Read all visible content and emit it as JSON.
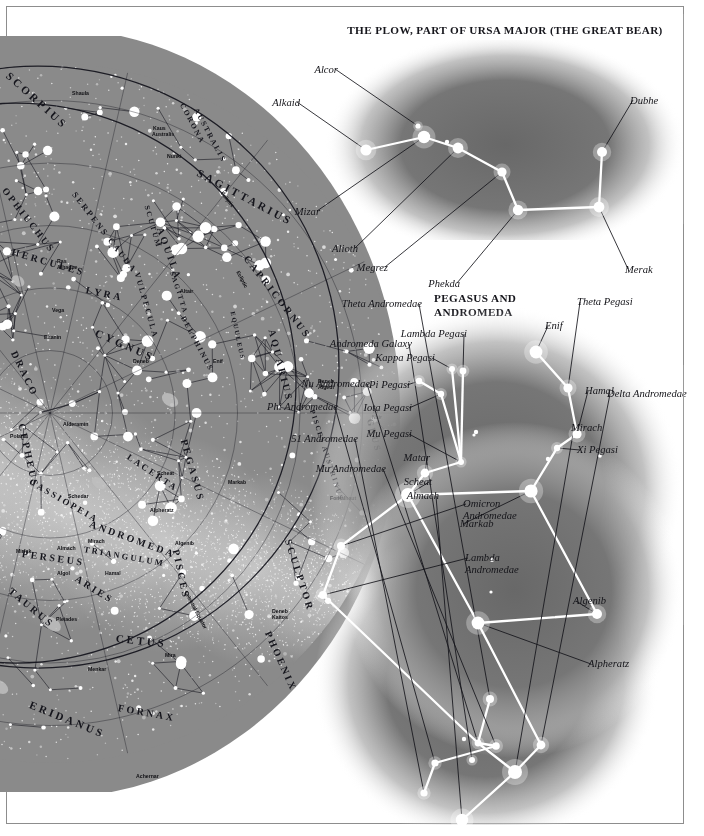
{
  "page": {
    "kind": "astronomy-plate",
    "background_color": "#ffffff",
    "frame_color": "#8d8d8d",
    "sky_color": "#8a8a8a",
    "star_color": "#ffffff",
    "line_color": "#14141a",
    "constellation_line_color": "#ffffff"
  },
  "plow": {
    "title": "THE PLOW, PART OF URSA MAJOR (THE GREAT BEAR)",
    "stars": [
      {
        "name": "Alkaid",
        "x": 66,
        "y": 110,
        "r": 5.6,
        "label_x": 0,
        "label_y": 57,
        "align": "right"
      },
      {
        "name": "Mizar",
        "x": 124,
        "y": 97,
        "r": 6.2,
        "label_x": 20,
        "label_y": 166,
        "align": "right"
      },
      {
        "name": "Alcor",
        "x": 118,
        "y": 86,
        "r": 2.6,
        "label_x": 38,
        "label_y": 24,
        "align": "right"
      },
      {
        "name": "Alioth",
        "x": 158,
        "y": 108,
        "r": 5.4,
        "label_x": 58,
        "label_y": 203,
        "align": "right"
      },
      {
        "name": "Megrez",
        "x": 202,
        "y": 132,
        "r": 4.6,
        "label_x": 88,
        "label_y": 222,
        "align": "right"
      },
      {
        "name": "Phekda",
        "x": 218,
        "y": 170,
        "r": 5.2,
        "label_x": 160,
        "label_y": 238,
        "align": "right"
      },
      {
        "name": "Merak",
        "x": 299,
        "y": 167,
        "r": 5.4,
        "label_x": 325,
        "label_y": 224,
        "align": "left"
      },
      {
        "name": "Dubhe",
        "x": 302,
        "y": 112,
        "r": 5.0,
        "label_x": 330,
        "label_y": 55,
        "align": "left"
      }
    ],
    "unlabeled_stars": [
      {
        "x": 147,
        "y": 102,
        "r": 2.2
      }
    ],
    "links": [
      [
        "Alkaid",
        "Mizar"
      ],
      [
        "Mizar",
        "Alioth"
      ],
      [
        "Alioth",
        "Megrez"
      ],
      [
        "Megrez",
        "Phekda"
      ],
      [
        "Phekda",
        "Merak"
      ],
      [
        "Merak",
        "Dubhe"
      ]
    ]
  },
  "pegasus": {
    "title_line1": "PEGASUS AND",
    "title_line2": "ANDROMEDA",
    "stars": [
      {
        "name": "Theta Pegasi",
        "x": 268,
        "y": 108,
        "r": 4.6,
        "label_x": 277,
        "label_y": 16,
        "align": "left"
      },
      {
        "name": "Enif",
        "x": 236,
        "y": 72,
        "r": 6.4,
        "label_x": 245,
        "label_y": 40,
        "align": "left"
      },
      {
        "name": "Hamal",
        "x": 277,
        "y": 154,
        "r": 4.6,
        "label_x": 285,
        "label_y": 105,
        "align": "left"
      },
      {
        "name": "Xi Pegasi",
        "x": 257,
        "y": 168,
        "r": 3.2,
        "label_x": 277,
        "label_y": 164,
        "align": "left"
      },
      {
        "name": "Markab",
        "x": 231,
        "y": 211,
        "r": 6.6,
        "label_x": 160,
        "label_y": 238,
        "align": "left"
      },
      {
        "name": "Algenib",
        "x": 297,
        "y": 334,
        "r": 5.0,
        "label_x": 273,
        "label_y": 315,
        "align": "left"
      },
      {
        "name": "Alpheratz",
        "x": 178,
        "y": 343,
        "r": 6.4,
        "label_x": 288,
        "label_y": 378,
        "align": "left"
      },
      {
        "name": "Lambda Pegasi",
        "x": 163,
        "y": 91,
        "r": 3.4,
        "label_x": 167,
        "label_y": 48,
        "align": "right"
      },
      {
        "name": "Kappa Pegasi",
        "x": 152,
        "y": 89,
        "r": 3.0,
        "label_x": 135,
        "label_y": 72,
        "align": "right"
      },
      {
        "name": "Pi Pegasi",
        "x": 119,
        "y": 101,
        "r": 3.2,
        "label_x": 110,
        "label_y": 99,
        "align": "right"
      },
      {
        "name": "Iota Pegasi",
        "x": 141,
        "y": 114,
        "r": 3.2,
        "label_x": 112,
        "label_y": 122,
        "align": "right"
      },
      {
        "name": "Mu Pegasi",
        "x": 161,
        "y": 182,
        "r": 3.0,
        "label_x": 112,
        "label_y": 148,
        "align": "right"
      },
      {
        "name": "Matar",
        "x": 125,
        "y": 193,
        "r": 4.4,
        "label_x": 130,
        "label_y": 172,
        "align": "right"
      },
      {
        "name": "Scheat",
        "x": 108,
        "y": 215,
        "r": 7.0,
        "label_x": 132,
        "label_y": 196,
        "align": "right"
      },
      {
        "name": "Omicron Andromedae",
        "x": 41,
        "y": 266,
        "r": 4.0,
        "label_x": 163,
        "label_y": 218,
        "align": "left"
      },
      {
        "name": "Lambda Andromedae",
        "x": 23,
        "y": 315,
        "r": 4.0,
        "label_x": 165,
        "label_y": 272,
        "align": "left"
      },
      {
        "name": "Theta Andromedae",
        "x": 190,
        "y": 419,
        "r": 4.0,
        "label_x": 122,
        "label_y": 18,
        "align": "right"
      },
      {
        "name": "Andromeda Galaxy",
        "x": 172,
        "y": 480,
        "r": 3.0,
        "label_x": 112,
        "label_y": 58,
        "align": "right"
      },
      {
        "name": "Nu Andromedae",
        "x": 178,
        "y": 463,
        "r": 3.4,
        "label_x": 70,
        "label_y": 98,
        "align": "right"
      },
      {
        "name": "Phi Andromedae",
        "x": 135,
        "y": 483,
        "r": 3.6,
        "label_x": 38,
        "label_y": 121,
        "align": "right"
      },
      {
        "name": "51 Andromedae",
        "x": 124,
        "y": 513,
        "r": 3.6,
        "label_x": 58,
        "label_y": 153,
        "align": "right"
      },
      {
        "name": "Mu Andromedae",
        "x": 196,
        "y": 466,
        "r": 3.8,
        "label_x": 86,
        "label_y": 183,
        "align": "right"
      },
      {
        "name": "Almach",
        "x": 162,
        "y": 540,
        "r": 6.2,
        "label_x": 139,
        "label_y": 210,
        "align": "right"
      },
      {
        "name": "Mirach",
        "x": 215,
        "y": 492,
        "r": 7.0,
        "label_x": 271,
        "label_y": 142,
        "align": "left"
      },
      {
        "name": "Delta Andromedae",
        "x": 241,
        "y": 465,
        "r": 4.4,
        "label_x": 307,
        "label_y": 108,
        "align": "left"
      }
    ],
    "unlabeled_stars": [
      {
        "x": 248,
        "y": 179,
        "r": 2.2
      },
      {
        "x": 300,
        "y": 176,
        "r": 1.8
      },
      {
        "x": 176,
        "y": 152,
        "r": 2.2
      },
      {
        "x": 174,
        "y": 155,
        "r": 1.6
      },
      {
        "x": 192,
        "y": 280,
        "r": 2.0
      },
      {
        "x": 191,
        "y": 312,
        "r": 1.6
      },
      {
        "x": 164,
        "y": 459,
        "r": 2.2
      }
    ],
    "links": [
      [
        "Enif",
        "Theta Pegasi"
      ],
      [
        "Theta Pegasi",
        "Hamal"
      ],
      [
        "Hamal",
        "Xi Pegasi"
      ],
      [
        "Xi Pegasi",
        "Markab"
      ],
      [
        "Markab",
        "Algenib"
      ],
      [
        "Algenib",
        "Alpheratz"
      ],
      [
        "Markab",
        "Scheat"
      ],
      [
        "Scheat",
        "Alpheratz"
      ],
      [
        "Scheat",
        "Matar"
      ],
      [
        "Matar",
        "Mu Pegasi"
      ],
      [
        "Mu Pegasi",
        "Iota Pegasi"
      ],
      [
        "Iota Pegasi",
        "Pi Pegasi"
      ],
      [
        "Mu Pegasi",
        "Kappa Pegasi"
      ],
      [
        "Mu Pegasi",
        "Lambda Pegasi"
      ],
      [
        "Scheat",
        "Omicron Andromedae"
      ],
      [
        "Omicron Andromedae",
        "Lambda Andromedae"
      ],
      [
        "Lambda Andromedae",
        "Nu Andromedae"
      ],
      [
        "Alpheratz",
        "Delta Andromedae"
      ],
      [
        "Delta Andromedae",
        "Mirach"
      ],
      [
        "Mirach",
        "Nu Andromedae"
      ],
      [
        "Nu Andromedae",
        "Theta Andromedae"
      ],
      [
        "Nu Andromedae",
        "Mu Andromedae"
      ],
      [
        "Mu Andromedae",
        "Phi Andromedae"
      ],
      [
        "Phi Andromedae",
        "51 Andromedae"
      ],
      [
        "Mirach",
        "Almach"
      ]
    ]
  },
  "starmap": {
    "constellations": [
      {
        "label": "SCORPIUS",
        "x": 8,
        "y": 32,
        "size": 11,
        "rot": 42
      },
      {
        "label": "CORONA",
        "x": 182,
        "y": 63,
        "size": 7.5,
        "rot": 62
      },
      {
        "label": "AUSTRALIS",
        "x": 196,
        "y": 68,
        "size": 7.5,
        "rot": 62
      },
      {
        "label": "SAGITTARIUS",
        "x": 198,
        "y": 130,
        "size": 11,
        "rot": 28
      },
      {
        "label": "OPHIUCHUS",
        "x": 4,
        "y": 148,
        "size": 9.5,
        "rot": 52
      },
      {
        "label": "SERPENS CAUDA",
        "x": 74,
        "y": 152,
        "size": 8.5,
        "rot": 52
      },
      {
        "label": "SCUTUM",
        "x": 147,
        "y": 165,
        "size": 7.5,
        "rot": 74
      },
      {
        "label": "HERCULES",
        "x": 12,
        "y": 210,
        "size": 10,
        "rot": 16
      },
      {
        "label": "AQUILA",
        "x": 160,
        "y": 186,
        "size": 10,
        "rot": 70
      },
      {
        "label": "CAPRICORNUS",
        "x": 246,
        "y": 215,
        "size": 10,
        "rot": 52
      },
      {
        "label": "LYRA",
        "x": 86,
        "y": 248,
        "size": 10,
        "rot": 12
      },
      {
        "label": "VULPECULA",
        "x": 137,
        "y": 232,
        "size": 8,
        "rot": 74
      },
      {
        "label": "SAGITTA",
        "x": 172,
        "y": 232,
        "size": 7,
        "rot": 72
      },
      {
        "label": "DELPHINUS",
        "x": 183,
        "y": 276,
        "size": 7.5,
        "rot": 62
      },
      {
        "label": "CYGNUS",
        "x": 96,
        "y": 290,
        "size": 11,
        "rot": 24
      },
      {
        "label": "DRACO",
        "x": 14,
        "y": 310,
        "size": 10,
        "rot": 64
      },
      {
        "label": "EQUULEUS",
        "x": 233,
        "y": 272,
        "size": 6.5,
        "rot": 78
      },
      {
        "label": "AQUARIUS",
        "x": 272,
        "y": 288,
        "size": 10,
        "rot": 76
      },
      {
        "label": "CEPHEUS",
        "x": 22,
        "y": 382,
        "size": 10,
        "rot": 78
      },
      {
        "label": "LACERTA",
        "x": 128,
        "y": 415,
        "size": 9,
        "rot": 34
      },
      {
        "label": "PEGASUS",
        "x": 184,
        "y": 398,
        "size": 10,
        "rot": 74
      },
      {
        "label": "PISCES AUSTRINUS",
        "x": 312,
        "y": 370,
        "size": 7,
        "rot": 72
      },
      {
        "label": "GRUS",
        "x": 370,
        "y": 378,
        "size": 9,
        "rot": 76
      },
      {
        "label": "CASSIOPEIA",
        "x": 30,
        "y": 440,
        "size": 9,
        "rot": 30
      },
      {
        "label": "ANDROMEDA",
        "x": 90,
        "y": 482,
        "size": 10,
        "rot": 20
      },
      {
        "label": "PISCES",
        "x": 176,
        "y": 508,
        "size": 10,
        "rot": 78
      },
      {
        "label": "SCULPTOR",
        "x": 288,
        "y": 498,
        "size": 10,
        "rot": 72
      },
      {
        "label": "PERSEUS",
        "x": 22,
        "y": 512,
        "size": 10,
        "rot": 8
      },
      {
        "label": "TRIANGULUM",
        "x": 84,
        "y": 508,
        "size": 8.5,
        "rot": 10
      },
      {
        "label": "ARIES",
        "x": 76,
        "y": 536,
        "size": 10,
        "rot": 32
      },
      {
        "label": "TAURUS",
        "x": 10,
        "y": 548,
        "size": 10,
        "rot": 40
      },
      {
        "label": "CETUS",
        "x": 116,
        "y": 596,
        "size": 11,
        "rot": 6
      },
      {
        "label": "PHOENIX",
        "x": 268,
        "y": 590,
        "size": 10,
        "rot": 66
      },
      {
        "label": "ERIDANUS",
        "x": 30,
        "y": 662,
        "size": 11,
        "rot": 22
      },
      {
        "label": "FORNAX",
        "x": 118,
        "y": 666,
        "size": 10,
        "rot": 10
      }
    ],
    "stars_named": [
      {
        "label": "Shaula",
        "x": 72,
        "y": 54
      },
      {
        "label": "Kaus",
        "x": 153,
        "y": 89
      },
      {
        "label": "Australis",
        "x": 152,
        "y": 95
      },
      {
        "label": "Nunki",
        "x": 167,
        "y": 117
      },
      {
        "label": "Ras",
        "x": 57,
        "y": 222
      },
      {
        "label": "Alhague",
        "x": 57,
        "y": 228
      },
      {
        "label": "Altair",
        "x": 180,
        "y": 252
      },
      {
        "label": "Vega",
        "x": 52,
        "y": 271
      },
      {
        "label": "Eltanin",
        "x": 44,
        "y": 298
      },
      {
        "label": "Deneb",
        "x": 133,
        "y": 322
      },
      {
        "label": "Enif",
        "x": 213,
        "y": 322
      },
      {
        "label": "Deneb",
        "x": 318,
        "y": 342
      },
      {
        "label": "Algedi",
        "x": 318,
        "y": 348
      },
      {
        "label": "Al",
        "x": 373,
        "y": 372
      },
      {
        "label": "Nair",
        "x": 372,
        "y": 378
      },
      {
        "label": "Alderamin",
        "x": 63,
        "y": 385
      },
      {
        "label": "Polaris",
        "x": 10,
        "y": 397
      },
      {
        "label": "Scheat",
        "x": 157,
        "y": 434
      },
      {
        "label": "Markab",
        "x": 228,
        "y": 443
      },
      {
        "label": "Fomalhaut",
        "x": 330,
        "y": 459
      },
      {
        "label": "Schedar",
        "x": 68,
        "y": 457
      },
      {
        "label": "Alpheratz",
        "x": 150,
        "y": 471
      },
      {
        "label": "Mirach",
        "x": 88,
        "y": 502
      },
      {
        "label": "Algenib",
        "x": 175,
        "y": 504
      },
      {
        "label": "Mirfak",
        "x": 16,
        "y": 512
      },
      {
        "label": "Almach",
        "x": 57,
        "y": 509
      },
      {
        "label": "Algol",
        "x": 57,
        "y": 534
      },
      {
        "label": "Hamal",
        "x": 105,
        "y": 534
      },
      {
        "label": "Deneb",
        "x": 272,
        "y": 572
      },
      {
        "label": "Kaitos",
        "x": 272,
        "y": 578
      },
      {
        "label": "Pleiades",
        "x": 56,
        "y": 580
      },
      {
        "label": "Mira",
        "x": 165,
        "y": 616
      },
      {
        "label": "Menkar",
        "x": 88,
        "y": 630
      },
      {
        "label": "Achernar",
        "x": 136,
        "y": 737
      }
    ],
    "reference_lines": [
      {
        "label": "Ecliptic",
        "x": 222,
        "y": 153,
        "rot": 52
      },
      {
        "label": "Ecliptic",
        "x": 238,
        "y": 232,
        "rot": 62
      },
      {
        "label": "Celestial Equator",
        "x": 186,
        "y": 552,
        "rot": 62
      }
    ]
  }
}
